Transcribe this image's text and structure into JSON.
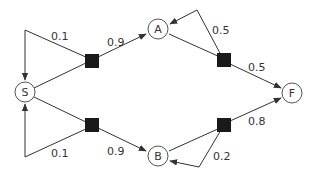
{
  "diagram": {
    "type": "markov-decision-process",
    "states": [
      {
        "id": "S",
        "label": "S"
      },
      {
        "id": "A",
        "label": "A"
      },
      {
        "id": "B",
        "label": "B"
      },
      {
        "id": "F",
        "label": "F"
      }
    ],
    "actions": [
      {
        "id": "a_S_top",
        "from": "S",
        "transitions": [
          {
            "to": "A",
            "p": "0.9"
          },
          {
            "to": "S",
            "p": "0.1"
          }
        ]
      },
      {
        "id": "a_S_bottom",
        "from": "S",
        "transitions": [
          {
            "to": "B",
            "p": "0.9"
          },
          {
            "to": "S",
            "p": "0.1"
          }
        ]
      },
      {
        "id": "a_A",
        "from": "A",
        "transitions": [
          {
            "to": "F",
            "p": "0.5"
          },
          {
            "to": "A",
            "p": "0.5"
          }
        ]
      },
      {
        "id": "a_B",
        "from": "B",
        "transitions": [
          {
            "to": "F",
            "p": "0.8"
          },
          {
            "to": "B",
            "p": "0.2"
          }
        ]
      }
    ],
    "labels": {
      "s_top_self": "0.1",
      "s_to_a": "0.9",
      "a_self": "0.5",
      "a_to_f": "0.5",
      "s_bottom_self": "0.1",
      "s_to_b": "0.9",
      "b_to_f": "0.8",
      "b_self": "0.2"
    }
  }
}
